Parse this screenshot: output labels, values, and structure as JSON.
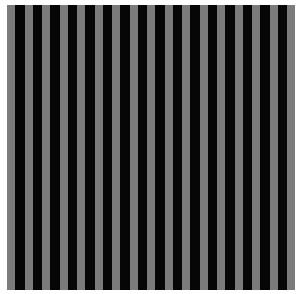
{
  "image": {
    "description": "Vertical stripe pattern alternating gray and black",
    "background": "#ffffff",
    "stripe_colors": {
      "light": "#7b7b7b",
      "dark": "#060606"
    },
    "stripe_count_light": 17,
    "stripe_count_dark": 16,
    "light_width_px": 8,
    "dark_width_px": 9.5
  }
}
